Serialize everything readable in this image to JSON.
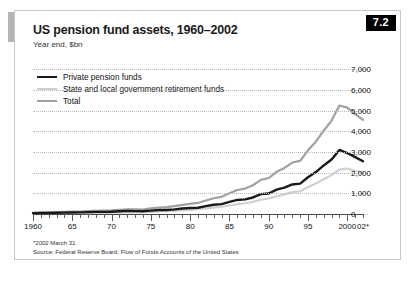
{
  "figure": {
    "badge": "7.2",
    "title": "US pension fund assets, 1960–2002",
    "subtitle": "Year end, $bn",
    "footnote": "*2002 March 31",
    "source": "Source: Federal Reserve Board, Flow of Funds Accounts of the United States"
  },
  "colors": {
    "private": "#1a1a1a",
    "state_local": "#cfcfcf",
    "total": "#a0a0a0",
    "badge_bg": "#000000",
    "accent_bar": "#b5b5b5",
    "grid": "#b8b8b8",
    "axis": "#4a4a4a"
  },
  "legend": [
    {
      "label": "Private pension funds",
      "key": "private"
    },
    {
      "label": "State and local government retirement funds",
      "key": "state_local"
    },
    {
      "label": "Total",
      "key": "total"
    }
  ],
  "chart_data": {
    "type": "line",
    "title": "US pension fund assets, 1960–2002",
    "subtitle": "Year end, $bn",
    "xlabel": "",
    "ylabel": "$bn",
    "xlim": [
      1960,
      2002
    ],
    "ylim": [
      0,
      7500
    ],
    "yticks": [
      0,
      1000,
      2000,
      3000,
      4000,
      5000,
      6000,
      7000
    ],
    "ytick_labels": [
      "0",
      "1,000",
      "2,000",
      "3,000",
      "4,000",
      "5,000",
      "6,000",
      "7,000"
    ],
    "xticks": [
      1960,
      1965,
      1970,
      1975,
      1980,
      1985,
      1990,
      1995,
      2000,
      2002
    ],
    "xtick_labels": [
      "1960",
      "65",
      "70",
      "75",
      "80",
      "85",
      "90",
      "95",
      "2000",
      "02*"
    ],
    "grid": "horizontal-dotted",
    "legend_position": "top-left",
    "x": [
      1960,
      1961,
      1962,
      1963,
      1964,
      1965,
      1966,
      1967,
      1968,
      1969,
      1970,
      1971,
      1972,
      1973,
      1974,
      1975,
      1976,
      1977,
      1978,
      1979,
      1980,
      1981,
      1982,
      1983,
      1984,
      1985,
      1986,
      1987,
      1988,
      1989,
      1990,
      1991,
      1992,
      1993,
      1994,
      1995,
      1996,
      1997,
      1998,
      1999,
      2000,
      2001,
      2002
    ],
    "series": [
      {
        "name": "Private pension funds",
        "key": "private",
        "values": [
          40,
          45,
          52,
          58,
          66,
          75,
          80,
          92,
          103,
          105,
          112,
          130,
          150,
          140,
          130,
          165,
          190,
          195,
          225,
          265,
          290,
          305,
          380,
          450,
          480,
          590,
          680,
          710,
          800,
          960,
          990,
          1180,
          1280,
          1430,
          1470,
          1780,
          2030,
          2350,
          2640,
          3100,
          2950,
          2750,
          2550
        ]
      },
      {
        "name": "State and local government retirement funds",
        "key": "state_local",
        "values": [
          20,
          22,
          25,
          28,
          32,
          36,
          40,
          45,
          50,
          55,
          60,
          68,
          78,
          82,
          88,
          105,
          125,
          140,
          155,
          175,
          200,
          230,
          270,
          310,
          350,
          410,
          480,
          520,
          590,
          690,
          750,
          860,
          950,
          1060,
          1100,
          1300,
          1470,
          1680,
          1880,
          2150,
          2200,
          2080,
          2000
        ]
      },
      {
        "name": "Total",
        "key": "total",
        "values": [
          60,
          67,
          77,
          86,
          98,
          111,
          120,
          137,
          153,
          160,
          172,
          198,
          228,
          222,
          218,
          270,
          315,
          335,
          380,
          440,
          490,
          535,
          650,
          760,
          830,
          1000,
          1160,
          1230,
          1390,
          1650,
          1740,
          2040,
          2230,
          2490,
          2570,
          3080,
          3500,
          4030,
          4520,
          5250,
          5150,
          4830,
          4550
        ]
      }
    ],
    "notes": {
      "peak_total": {
        "year": 1999,
        "value": 6900
      },
      "peak_private": {
        "year": 1999,
        "value": 4700
      },
      "end_total": {
        "year": 2002,
        "value": 6300
      },
      "end_private": {
        "year": 2002,
        "value": 4300
      },
      "end_state_local": {
        "year": 2002,
        "value": 2150
      }
    }
  }
}
